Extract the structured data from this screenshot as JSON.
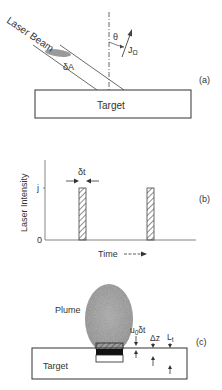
{
  "panel_a": {
    "label": "(a)",
    "beam_label": "Laser Beam",
    "area_label": "δA",
    "angle_label": "θ",
    "flux_label": "J",
    "flux_subscript": "Ω",
    "target_label": "Target"
  },
  "panel_b": {
    "label": "(b)",
    "ylabel": "Laser Intensity",
    "xlabel": "Time",
    "y_tick_top": "j",
    "y_tick_zero": "0",
    "pulse_width_label": "δt"
  },
  "panel_c": {
    "label": "(c)",
    "plume_label": "Plume",
    "target_label": "Target",
    "displacement_label": "u",
    "displacement_sub": "0",
    "displacement_suffix": "δt",
    "dz_label": "Δz",
    "lt_label": "L",
    "lt_sub": "t"
  },
  "colors": {
    "line": "#333333",
    "plume": "#9a9a9a",
    "hatch": "#555555"
  }
}
